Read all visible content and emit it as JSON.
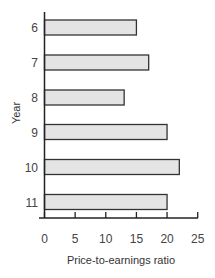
{
  "chart_data": {
    "type": "bar",
    "orientation": "horizontal",
    "title": "",
    "xlabel": "Price-to-earnings ratio",
    "ylabel": "Year",
    "categories": [
      "6",
      "7",
      "8",
      "9",
      "10",
      "11"
    ],
    "values": [
      15,
      17,
      13,
      20,
      22,
      20
    ],
    "xlim": [
      0,
      25
    ],
    "xticks": [
      0,
      5,
      10,
      15,
      20,
      25
    ],
    "grid": false,
    "legend": null,
    "colors": {
      "bar_fill": "#e4e4e4",
      "bar_stroke": "#333333",
      "axis": "#222222"
    }
  }
}
